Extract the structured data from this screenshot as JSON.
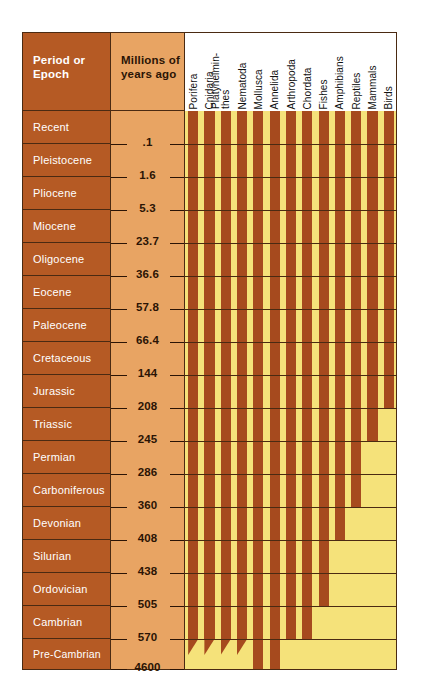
{
  "headers": {
    "period": "Period or Epoch",
    "age": "Millions of years ago"
  },
  "colors": {
    "period_column": "#b55a24",
    "age_column": "#e8a463",
    "chart_background": "#f5e27a",
    "bar": "#a64a1e",
    "border": "#4a2a12",
    "text_light": "#ffffff",
    "text_dark": "#2b1405"
  },
  "chart_data": {
    "type": "bar",
    "orientation": "vertical-ranges",
    "xlabel": "",
    "ylabel": "Millions of years ago",
    "grid": true,
    "legend": "none",
    "periods": [
      {
        "name": "Recent",
        "end_mya": 0.1
      },
      {
        "name": "Pleistocene",
        "end_mya": 1.6
      },
      {
        "name": "Pliocene",
        "end_mya": 5.3
      },
      {
        "name": "Miocene",
        "end_mya": 23.7
      },
      {
        "name": "Oligocene",
        "end_mya": 36.6
      },
      {
        "name": "Eocene",
        "end_mya": 57.8
      },
      {
        "name": "Paleocene",
        "end_mya": 66.4
      },
      {
        "name": "Cretaceous",
        "end_mya": 144
      },
      {
        "name": "Jurassic",
        "end_mya": 208
      },
      {
        "name": "Triassic",
        "end_mya": 245
      },
      {
        "name": "Permian",
        "end_mya": 286
      },
      {
        "name": "Carboniferous",
        "end_mya": 360
      },
      {
        "name": "Devonian",
        "end_mya": 408
      },
      {
        "name": "Silurian",
        "end_mya": 438
      },
      {
        "name": "Ordovician",
        "end_mya": 505
      },
      {
        "name": "Cambrian",
        "end_mya": 570
      },
      {
        "name": "Pre-Cambrian",
        "end_mya": 4600
      }
    ],
    "age_ticks": [
      0.1,
      1.6,
      5.3,
      23.7,
      36.6,
      57.8,
      66.4,
      144,
      208,
      245,
      286,
      360,
      408,
      438,
      505,
      570,
      4600
    ],
    "age_tick_labels": [
      ".1",
      "1.6",
      "5.3",
      "23.7",
      "36.6",
      "57.8",
      "66.4",
      "144",
      "208",
      "245",
      "286",
      "360",
      "408",
      "438",
      "505",
      "570",
      "4600"
    ],
    "categories": [
      "Porifera",
      "Cnidaria",
      "Platyhelminthes",
      "Nematoda",
      "Mollusca",
      "Annelida",
      "Arthropoda",
      "Chordata",
      "Fishes",
      "Amphibians",
      "Reptiles",
      "Mammals",
      "Birds"
    ],
    "ranges": [
      {
        "taxon": "Porifera",
        "label_lines": [
          "Porifera"
        ],
        "first_appearance_period": "Pre-Cambrian",
        "tapered": true
      },
      {
        "taxon": "Cnidaria",
        "label_lines": [
          "Cnidaria"
        ],
        "first_appearance_period": "Pre-Cambrian",
        "tapered": true
      },
      {
        "taxon": "Platyhelminthes",
        "label_lines": [
          "Platyhelmin-",
          "thes"
        ],
        "first_appearance_period": "Pre-Cambrian",
        "tapered": true
      },
      {
        "taxon": "Nematoda",
        "label_lines": [
          "Nematoda"
        ],
        "first_appearance_period": "Pre-Cambrian",
        "tapered": true
      },
      {
        "taxon": "Mollusca",
        "label_lines": [
          "Mollusca"
        ],
        "first_appearance_period": "Pre-Cambrian",
        "tapered": false
      },
      {
        "taxon": "Annelida",
        "label_lines": [
          "Annelida"
        ],
        "first_appearance_period": "Pre-Cambrian",
        "tapered": false
      },
      {
        "taxon": "Arthropoda",
        "label_lines": [
          "Arthropoda"
        ],
        "first_appearance_period": "Cambrian",
        "tapered": false
      },
      {
        "taxon": "Chordata",
        "label_lines": [
          "Chordata"
        ],
        "first_appearance_period": "Cambrian",
        "tapered": false
      },
      {
        "taxon": "Fishes",
        "label_lines": [
          "Fishes"
        ],
        "first_appearance_period": "Ordovician",
        "tapered": false
      },
      {
        "taxon": "Amphibians",
        "label_lines": [
          "Amphibians"
        ],
        "first_appearance_period": "Devonian",
        "tapered": false
      },
      {
        "taxon": "Reptiles",
        "label_lines": [
          "Reptiles"
        ],
        "first_appearance_period": "Carboniferous",
        "tapered": false
      },
      {
        "taxon": "Mammals",
        "label_lines": [
          "Mammals"
        ],
        "first_appearance_period": "Triassic",
        "tapered": false
      },
      {
        "taxon": "Birds",
        "label_lines": [
          "Birds"
        ],
        "first_appearance_period": "Jurassic",
        "tapered": false
      }
    ]
  }
}
